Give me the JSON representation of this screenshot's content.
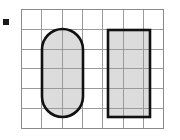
{
  "figure": {
    "background_color": "#ffffff",
    "width": 180,
    "height": 140
  },
  "bullet_marker": {
    "name": "bullet-square",
    "shape": "filled-square",
    "color": "#1a1a1a",
    "x": 3,
    "y": 19,
    "size": 6
  },
  "grid": {
    "columns": 7,
    "rows": 6,
    "cell_width": 20.3,
    "cell_height": 19.8,
    "origin_x": 21,
    "origin_y": 9,
    "line_color": "#9a9a9a",
    "border_color": "#8a8a8a",
    "line_width": 1,
    "background_color": "#ffffff"
  },
  "shapes": [
    {
      "name": "stadium",
      "label": "rounded capsule shape",
      "type": "stadium",
      "x": 42,
      "y": 29,
      "width": 41,
      "height": 88,
      "corner_radius": 20.5,
      "fill": "#dcdcdc",
      "stroke": "#111111",
      "stroke_width": 2.6,
      "grid_cells_wide": 2,
      "grid_cells_tall": 4.4
    },
    {
      "name": "rectangle",
      "label": "upright rectangle",
      "type": "rectangle",
      "x": 108,
      "y": 30,
      "width": 42,
      "height": 87,
      "fill": "#dcdcdc",
      "stroke": "#111111",
      "stroke_width": 2.6,
      "grid_cells_wide": 2,
      "grid_cells_tall": 4.4
    }
  ]
}
